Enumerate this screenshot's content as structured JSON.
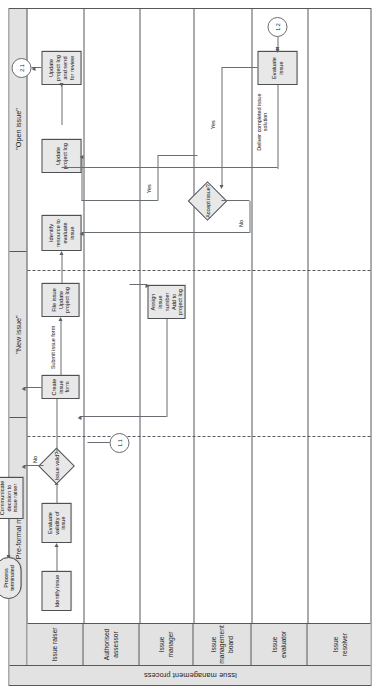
{
  "pool": {
    "title": "Issue management process"
  },
  "phases": [
    {
      "label": "Pre-formal management"
    },
    {
      "label": "\"New issue\""
    },
    {
      "label": "\"Open issue\""
    }
  ],
  "lanes": [
    {
      "label": "Issue raiser"
    },
    {
      "label": "Authorised assessor"
    },
    {
      "label": "Issue manager"
    },
    {
      "label": "Issue management board"
    },
    {
      "label": "Issue evaluator"
    },
    {
      "label": "Issue resolver"
    }
  ],
  "tasks": [
    {
      "id": "identify-issue",
      "label": "Identify issue"
    },
    {
      "id": "evaluate-validity",
      "label": "Evaluate validity of issue"
    },
    {
      "id": "communicate-decision",
      "label": "Communicate decision to issue raiser"
    },
    {
      "id": "create-issue-form",
      "label": "Create issue form"
    },
    {
      "id": "assign-issue-number",
      "label": "Assign issue number Add to project log"
    },
    {
      "id": "file-issue",
      "label": "File issue Update project log"
    },
    {
      "id": "identify-resource",
      "label": "Identify resource to evaluate issue"
    },
    {
      "id": "update-project-log",
      "label": "Update project log"
    },
    {
      "id": "update-log-review",
      "label": "Update project log and send for review"
    },
    {
      "id": "evaluate-issue",
      "label": "Evaluate issue"
    }
  ],
  "gateways": [
    {
      "id": "issue-valid",
      "label": "Issue valid?"
    },
    {
      "id": "accept-issue",
      "label": "Accept issue?"
    }
  ],
  "events": [
    {
      "id": "process-terminated",
      "label": "Process terminated",
      "type": "end"
    },
    {
      "id": "link-1-1",
      "label": "1.1",
      "type": "link"
    },
    {
      "id": "link-2-1",
      "label": "2.1",
      "type": "link"
    },
    {
      "id": "link-1-2",
      "label": "1.2",
      "type": "link"
    }
  ],
  "flow_labels": [
    {
      "id": "valid-no",
      "label": "No"
    },
    {
      "id": "submit-issue-form",
      "label": "Submit issue form"
    },
    {
      "id": "accept-yes-upper",
      "label": "Yes"
    },
    {
      "id": "accept-yes-lower",
      "label": "Yes"
    },
    {
      "id": "accept-no",
      "label": "No"
    },
    {
      "id": "deliver-solution",
      "label": "Deliver completed issue solution"
    }
  ],
  "colors": {
    "shape_fill": "#e8e8e8",
    "header_fill": "#e2e2e2",
    "stroke": "#55585c",
    "connector": "#6a6d71",
    "page": "#ffffff"
  }
}
